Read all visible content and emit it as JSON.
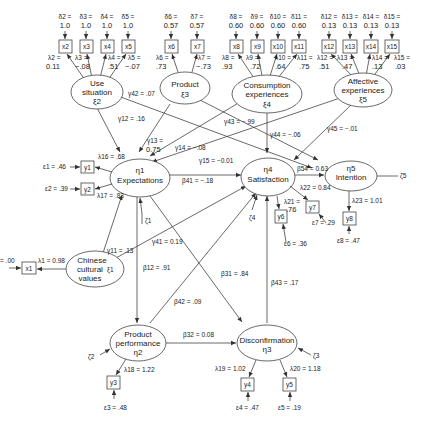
{
  "latent": {
    "xi2": {
      "label": "Use situation",
      "sym": "ξ2"
    },
    "xi3": {
      "label": "Product",
      "sym": "ξ3"
    },
    "xi4": {
      "label": "Consumption experiences",
      "sym": "ξ4"
    },
    "xi5": {
      "label": "Affective experiences",
      "sym": "ξ5"
    },
    "xi1": {
      "label": "Chinese cultural values",
      "sym": "ξ1"
    },
    "eta1": {
      "label": "Expectations",
      "sym": "η1"
    },
    "eta4": {
      "label": "Satisfaction",
      "sym": "η4"
    },
    "eta5": {
      "label": "Intention",
      "sym": "η5"
    },
    "eta2": {
      "label": "Product performance",
      "sym": "η2"
    },
    "eta3": {
      "label": "Disconfirmation",
      "sym": "η3"
    }
  },
  "x_indicators": [
    {
      "id": "x2",
      "delta": "δ2 =",
      "dval": "1.0",
      "lambda": "λ2 =",
      "lval": "0.11"
    },
    {
      "id": "x3",
      "delta": "δ3 =",
      "dval": "1.0",
      "lambda": "λ3 =",
      "lval": "−.08"
    },
    {
      "id": "x4",
      "delta": "δ4 =",
      "dval": "1.0",
      "lambda": "λ4 =",
      "lval": ".51"
    },
    {
      "id": "x5",
      "delta": "δ5 =",
      "dval": "1.0",
      "lambda": "λ5 =",
      "lval": "−.07"
    },
    {
      "id": "x6",
      "delta": "δ6 =",
      "dval": "0.57",
      "lambda": "λ6 =",
      "lval": ".73"
    },
    {
      "id": "x7",
      "delta": "δ7 =",
      "dval": "0.57",
      "lambda": "λ7 =",
      "lval": "−.73"
    },
    {
      "id": "x8",
      "delta": "δ8 =",
      "dval": "0.60",
      "lambda": "λ8 =",
      "lval": ".93"
    },
    {
      "id": "x9",
      "delta": "δ9 =",
      "dval": "0.60",
      "lambda": "λ9 =",
      "lval": ".72"
    },
    {
      "id": "x10",
      "delta": "δ10 =",
      "dval": "0.60",
      "lambda": "λ10 =",
      "lval": ".64"
    },
    {
      "id": "x11",
      "delta": "δ11 =",
      "dval": "0.60",
      "lambda": "λ11 =",
      "lval": ".75"
    },
    {
      "id": "x12",
      "delta": "δ12 =",
      "dval": "0.13",
      "lambda": "λ12 =",
      "lval": ".51"
    },
    {
      "id": "x13",
      "delta": "δ13 =",
      "dval": "0.13",
      "lambda": "λ13 =",
      "lval": ".47"
    },
    {
      "id": "x14",
      "delta": "δ14 =",
      "dval": "0.13",
      "lambda": "λ14 =",
      "lval": ".13"
    },
    {
      "id": "x15",
      "delta": "δ15 =",
      "dval": "0.13",
      "lambda": "λ15 =",
      "lval": ".03"
    }
  ],
  "x1": {
    "id": "x1",
    "delta": "= .00",
    "lambda": "λ1 = 0.98"
  },
  "y_indicators": {
    "y1": {
      "id": "y1",
      "eps": "ε1 = .46",
      "lambda": "λ16 = .68"
    },
    "y2": {
      "id": "y2",
      "eps": "ε2 = .39",
      "lambda": "λ17 = .83"
    },
    "y3": {
      "id": "y3",
      "eps": "ε3 = .48",
      "lambda": "λ18 = 1.22"
    },
    "y4": {
      "id": "y4",
      "eps": "ε4 = .47",
      "lambda": "λ19 = 1.02"
    },
    "y5": {
      "id": "y5",
      "eps": "ε5 = .19",
      "lambda": "λ20 = 1.18"
    },
    "y6": {
      "id": "y6",
      "eps": "ε6 = .36",
      "lambda1": "λ21 =",
      "lambda2": ".76"
    },
    "y7": {
      "id": "y7",
      "eps": "ε7 = .29",
      "lambda": "λ22 = 0.84"
    },
    "y8": {
      "id": "y8",
      "eps": "ε8 = .47",
      "lambda": "λ23 = 1.01"
    }
  },
  "paths": {
    "g12": "γ12 = .16",
    "g42": "γ42 = .07",
    "g13a": "γ13 =",
    "g13b": "0.75",
    "g14": "γ14 = −.08",
    "g15": "γ15 = −0.01",
    "g43": "γ43 = −.99",
    "g44": "γ44 = −.06",
    "g45": "γ45 = −.01",
    "g11": "γ11 = .13",
    "g41": "γ41 = 0.19",
    "b41": "β41 = −.18",
    "b54": "β54 = 0.63",
    "b12": "β12 = .91",
    "b31": "β31 = .84",
    "b42": "β42 = .09",
    "b43": "β43 = .17",
    "b32": "β32 = 0.08"
  },
  "disturbances": {
    "z1": "ζ1",
    "z2": "ζ2",
    "z3": "ζ3",
    "z4": "ζ4",
    "z5": "ζ5"
  }
}
